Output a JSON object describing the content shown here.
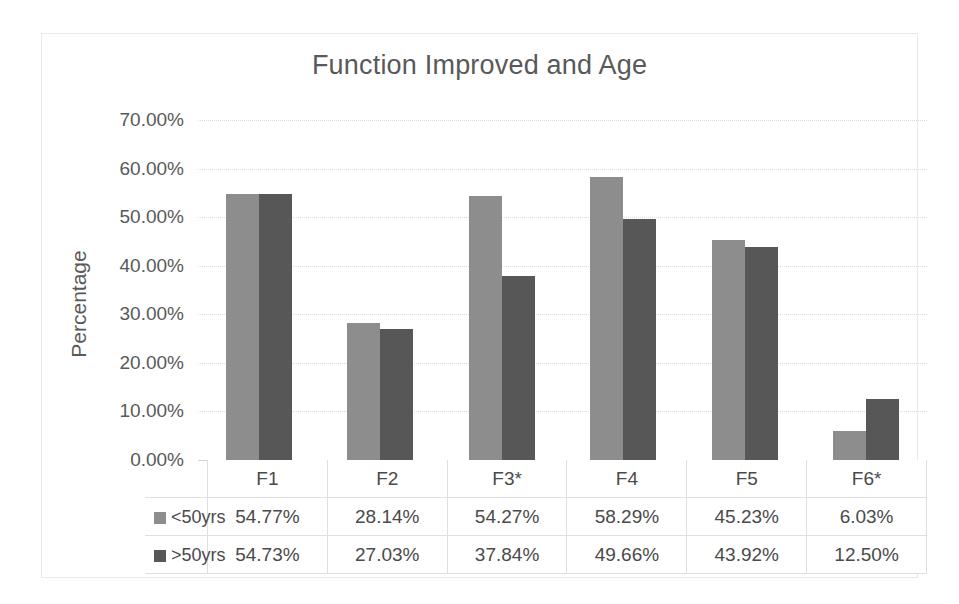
{
  "chart_data": {
    "type": "bar",
    "title": "Function Improved and Age",
    "xlabel": "",
    "ylabel": "Percentage",
    "ylim": [
      0,
      70
    ],
    "grid": true,
    "legend_position": "bottom-table",
    "categories": [
      "F1",
      "F2",
      "F3*",
      "F4",
      "F5",
      "F6*"
    ],
    "series": [
      {
        "name": "<50yrs",
        "color": "#8d8d8d",
        "values": [
          54.77,
          28.14,
          54.27,
          58.29,
          45.23,
          6.03
        ],
        "labels": [
          "54.77%",
          "28.14%",
          "54.27%",
          "58.29%",
          "45.23%",
          "6.03%"
        ]
      },
      {
        "name": ">50yrs",
        "color": "#575757",
        "values": [
          54.73,
          27.03,
          37.84,
          49.66,
          43.92,
          12.5
        ],
        "labels": [
          "54.73%",
          "27.03%",
          "37.84%",
          "49.66%",
          "43.92%",
          "12.50%"
        ]
      }
    ],
    "y_ticks": [
      {
        "value": 70,
        "label": "70.00%"
      },
      {
        "value": 60,
        "label": "60.00%"
      },
      {
        "value": 50,
        "label": "50.00%"
      },
      {
        "value": 40,
        "label": "40.00%"
      },
      {
        "value": 30,
        "label": "30.00%"
      },
      {
        "value": 20,
        "label": "20.00%"
      },
      {
        "value": 10,
        "label": "10.00%"
      },
      {
        "value": 0,
        "label": "0.00%"
      }
    ]
  }
}
